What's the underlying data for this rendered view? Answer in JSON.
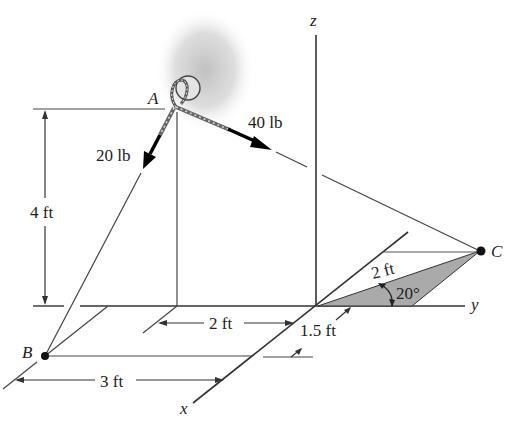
{
  "figure": {
    "type": "3D statics diagram",
    "axes": {
      "x_label": "x",
      "y_label": "y",
      "z_label": "z"
    },
    "points": {
      "A": "A",
      "B": "B",
      "C": "C"
    },
    "forces": {
      "force_AB": "20 lb",
      "force_AC": "40 lb"
    },
    "dimensions": {
      "height": "4 ft",
      "y_offset": "2 ft",
      "x_offset": "3 ft",
      "x_offset_small": "1.5 ft",
      "length_OC": "2 ft",
      "angle": "20°"
    },
    "colors": {
      "line": "#333333",
      "shade": "#aaaaaa",
      "haze": "#c8c8c8"
    }
  }
}
